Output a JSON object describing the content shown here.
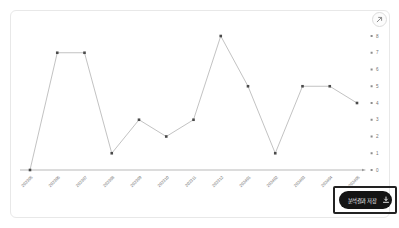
{
  "chart_data": {
    "type": "line",
    "categories": [
      "202305",
      "202306",
      "202307",
      "202308",
      "202309",
      "202310",
      "202311",
      "202312",
      "202401",
      "202402",
      "202403",
      "202404",
      "202405"
    ],
    "values": [
      0,
      7,
      7,
      1,
      3,
      2,
      3,
      8,
      5,
      1,
      5,
      5,
      4
    ],
    "series_name": "monthly-count",
    "title": "",
    "xlabel": "",
    "ylabel": "",
    "ylim": [
      0,
      8
    ],
    "yticks": [
      0,
      1,
      2,
      3,
      4,
      5,
      6,
      7,
      8
    ],
    "y_axis_side": "right",
    "grid": false,
    "legend": "none",
    "line_color": "#b3b3b3",
    "marker_color": "#4a4a4a",
    "axis_color": "#9c9c9c",
    "tick_label_color": "#737373"
  },
  "controls": {
    "expand_icon": "expand-arrow-icon",
    "save_button": {
      "label": "분석결과 저장",
      "icon": "download-icon",
      "bg_color": "#141414",
      "text_color": "#ffffff",
      "highlight_border_color": "#222222"
    }
  }
}
